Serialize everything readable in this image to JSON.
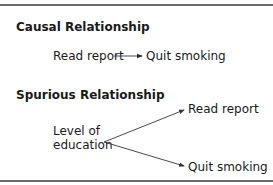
{
  "causal": {
    "heading": "Causal Relationship",
    "cause": "Read report",
    "effect": "Quit smoking"
  },
  "spurious": {
    "heading": "Spurious Relationship",
    "source_line1": "Level of",
    "source_line2": "education",
    "target_top": "Read report",
    "target_bottom": "Quit smoking"
  },
  "colors": {
    "text": "#1a1a1a",
    "rule": "#6a6a6a",
    "arrow": "#333333"
  }
}
